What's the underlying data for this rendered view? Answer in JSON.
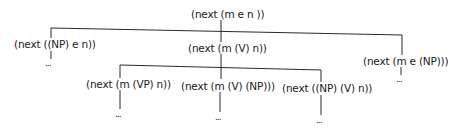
{
  "tree": {
    "root": {
      "label": "(next (m e n ))"
    },
    "level1": [
      {
        "label": "(next ((NP) e n))",
        "continuation": "..."
      },
      {
        "label": "(next (m (V) n))"
      },
      {
        "label": "(next (m e (NP)))",
        "continuation": "..."
      }
    ],
    "level2": [
      {
        "label": "(next (m (VP) n))",
        "continuation": "..."
      },
      {
        "label": "(next (m (V) (NP)))",
        "continuation": "..."
      },
      {
        "label": "(next ((NP) (V) n))",
        "continuation": "..."
      }
    ]
  },
  "colors": {
    "line": "#2a2a2a",
    "text": "#1a1a1a",
    "background": "#ffffff"
  }
}
